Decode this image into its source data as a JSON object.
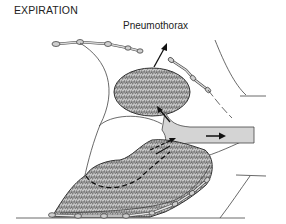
{
  "diagram": {
    "title": "EXPIRATION",
    "labels": {
      "pneumothorax": "Pneumothorax"
    },
    "components": [
      "flail-chest-segment-upper",
      "chest-wall-right-upper",
      "collapsed-lung-upper",
      "trachea-bronchus",
      "lower-lung",
      "diaphragm-ribs-lower",
      "airflow-arrow-trachea",
      "pneumothorax-arrow"
    ],
    "colors": {
      "line": "#333333",
      "lung_fill": "#c8c8c8",
      "lung_texture": "#4a4a4a",
      "airway_fill": "#d6d6d6",
      "rib_fill": "#cfcfcf"
    }
  }
}
